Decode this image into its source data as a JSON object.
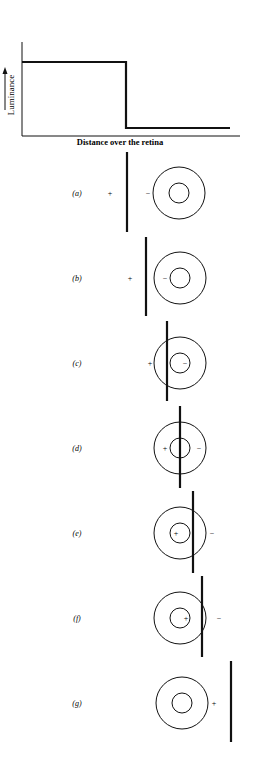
{
  "graph": {
    "y_label": "Luminance",
    "x_label": "Distance over the retina",
    "profile": {
      "high_level_y": 62,
      "low_level_y": 128,
      "edge_x": 126
    }
  },
  "panels": [
    {
      "label": "(a)",
      "bar_x": 127,
      "bar_top": 152,
      "bar_bottom": 232,
      "cy": 193,
      "cx": 179,
      "signs": [
        {
          "t": "+",
          "x": 110
        },
        {
          "t": "−",
          "x": 148
        }
      ]
    },
    {
      "label": "(b)",
      "bar_x": 146,
      "bar_top": 237,
      "bar_bottom": 316,
      "cy": 278,
      "cx": 180,
      "signs": [
        {
          "t": "+",
          "x": 130
        },
        {
          "t": "−",
          "x": 165
        }
      ]
    },
    {
      "label": "(c)",
      "bar_x": 167,
      "bar_top": 321,
      "bar_bottom": 401,
      "cy": 363,
      "cx": 180,
      "signs": [
        {
          "t": "+",
          "x": 150
        },
        {
          "t": "−",
          "x": 185
        }
      ]
    },
    {
      "label": "(d)",
      "bar_x": 180,
      "bar_top": 406,
      "bar_bottom": 488,
      "cy": 448,
      "cx": 180,
      "signs": [
        {
          "t": "+",
          "x": 165
        },
        {
          "t": "−",
          "x": 199
        }
      ]
    },
    {
      "label": "(e)",
      "bar_x": 193,
      "bar_top": 491,
      "bar_bottom": 573,
      "cy": 533,
      "cx": 180,
      "signs": [
        {
          "t": "+",
          "x": 176
        },
        {
          "t": "−",
          "x": 212
        }
      ]
    },
    {
      "label": "(f)",
      "bar_x": 202,
      "bar_top": 576,
      "bar_bottom": 657,
      "cy": 618,
      "cx": 180,
      "signs": [
        {
          "t": "+",
          "x": 186
        },
        {
          "t": "−",
          "x": 219
        }
      ]
    },
    {
      "label": "(g)",
      "bar_x": 231,
      "bar_top": 661,
      "bar_bottom": 742,
      "cy": 703,
      "cx": 182,
      "signs": [
        {
          "t": "+",
          "x": 214
        }
      ]
    }
  ],
  "receptive_field": {
    "outer_r": 26,
    "inner_r": 10
  },
  "colors": {
    "ink": "#111111",
    "background": "#ffffff"
  }
}
